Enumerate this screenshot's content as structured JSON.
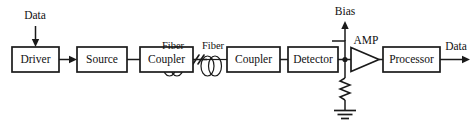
{
  "diagram": {
    "line_color": "#1a1a1a",
    "background": "#ffffff",
    "blocks": [
      {
        "id": "driver",
        "label": "Driver",
        "x": 12,
        "y": 47,
        "w": 47,
        "h": 25
      },
      {
        "id": "source",
        "label": "Source",
        "x": 77,
        "y": 47,
        "w": 50,
        "h": 25
      },
      {
        "id": "coupler1",
        "label": "Coupler",
        "x": 140,
        "y": 47,
        "w": 53,
        "h": 25
      },
      {
        "id": "coupler2",
        "label": "Coupler",
        "x": 227,
        "y": 47,
        "w": 53,
        "h": 25
      },
      {
        "id": "detector",
        "label": "Detector",
        "x": 288,
        "y": 47,
        "w": 50,
        "h": 25
      },
      {
        "id": "processor",
        "label": "Processor",
        "x": 383,
        "y": 47,
        "w": 57,
        "h": 25
      }
    ],
    "fiber_spools": [
      {
        "id": "fiber-left",
        "label": "Fiber",
        "cx": 173,
        "cy": 70,
        "label_x": 173,
        "label_y": 45
      },
      {
        "id": "fiber-right",
        "label": "Fiber",
        "cx": 211,
        "cy": 70,
        "label_x": 211,
        "label_y": 45
      }
    ],
    "break_mark": {
      "x": 192,
      "y": 60
    },
    "amplifier": {
      "id": "amp",
      "label": "AMP",
      "x": 351,
      "y": 48,
      "w": 28,
      "h": 24,
      "label_x": 365,
      "label_y": 41
    },
    "signals": [
      {
        "id": "data-in",
        "label": "Data",
        "x": 35,
        "y": 19,
        "direction": "down"
      },
      {
        "id": "bias",
        "label": "Bias",
        "x": 345,
        "y": 14,
        "direction": "up"
      },
      {
        "id": "data-out",
        "label": "Data",
        "x": 456,
        "y": 45,
        "direction": "right"
      }
    ],
    "passives": [
      {
        "id": "load-resistor",
        "type": "resistor",
        "x": 345,
        "y": 78,
        "length": 26
      },
      {
        "id": "ground",
        "type": "ground",
        "x": 345,
        "y": 110
      }
    ],
    "junction_node": {
      "id": "detector-output-node",
      "x": 345,
      "y": 60
    },
    "connections": [
      {
        "from": "driver",
        "to": "source",
        "arrow": true
      },
      {
        "from": "source",
        "to": "coupler1",
        "arrow": false
      },
      {
        "from": "coupler2",
        "to": "detector",
        "arrow": false
      },
      {
        "from": "detector",
        "to": "amp",
        "arrow": false
      },
      {
        "from": "amp",
        "to": "processor",
        "arrow": false
      }
    ]
  }
}
